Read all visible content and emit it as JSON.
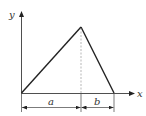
{
  "diagram": {
    "type": "triangular-distribution-sketch",
    "axes": {
      "x_label": "x",
      "y_label": "y"
    },
    "dimensions": {
      "left_segment_label": "a",
      "right_segment_label": "b"
    },
    "colors": {
      "stroke": "#222222",
      "dashed": "#888888",
      "background": "#ffffff"
    }
  }
}
